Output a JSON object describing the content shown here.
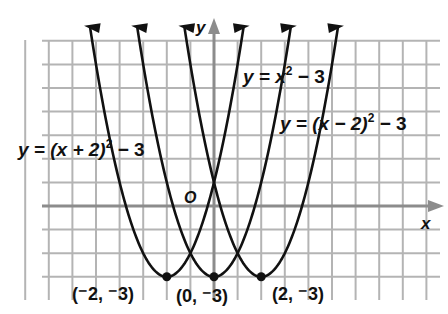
{
  "chart_data": {
    "type": "line",
    "title": "",
    "xlabel": "x",
    "ylabel": "y",
    "origin_label": "O",
    "grid": true,
    "xlim": [
      -8.5,
      9.5
    ],
    "ylim": [
      -4,
      8
    ],
    "series": [
      {
        "name": "y = (x + 2)^2 - 3",
        "label_parts": {
          "pre": "y = (x + 2)",
          "sup": "2",
          "post": " − 3"
        },
        "h": -2,
        "k": -3,
        "vertex_label": "(⁻2, ⁻3)"
      },
      {
        "name": "y = x^2 - 3",
        "label_parts": {
          "pre": "y = x",
          "sup": "2",
          "post": " − 3"
        },
        "h": 0,
        "k": -3,
        "vertex_label": "(0, ⁻3)"
      },
      {
        "name": "y = (x - 2)^2 - 3",
        "label_parts": {
          "pre": "y = (x − 2)",
          "sup": "2",
          "post": " − 3"
        },
        "h": 2,
        "k": -3,
        "vertex_label": "(2, ⁻3)"
      }
    ],
    "vertices": [
      [
        -2,
        -3
      ],
      [
        0,
        -3
      ],
      [
        2,
        -3
      ]
    ]
  },
  "colors": {
    "grid": "#b4b4b4",
    "axis": "#8c8c8c",
    "curve": "#111111"
  }
}
